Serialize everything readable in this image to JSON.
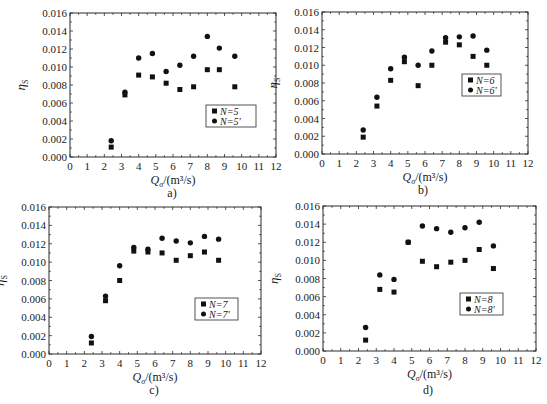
{
  "figure": {
    "x_tick_labels": [
      "0",
      "1",
      "2",
      "3",
      "4",
      "5",
      "6",
      "7",
      "8",
      "9",
      "10",
      "11",
      "12"
    ],
    "y_tick_labels": [
      "0.000",
      "0.002",
      "0.004",
      "0.006",
      "0.008",
      "0.010",
      "0.012",
      "0.014",
      "0.016"
    ],
    "xlabel": "Q_σ/(m³/s)",
    "xlabel_main": "Q",
    "xlabel_sub": "σ",
    "xlabel_unit": "/(m³/s)",
    "ylabel_main": "η",
    "ylabel_sub": "S"
  },
  "chart_data": [
    {
      "type": "scatter",
      "panel_label": "a)",
      "title": "",
      "xlabel": "Q_σ/(m³/s)",
      "ylabel": "η_S",
      "xlim": [
        0,
        12
      ],
      "ylim": [
        0,
        0.016
      ],
      "grid": false,
      "legend_position": "inside-right-lower",
      "series": [
        {
          "name": "N=5",
          "marker": "square",
          "x": [
            2.4,
            3.2,
            4.0,
            4.8,
            5.6,
            6.4,
            7.2,
            8.0,
            8.7,
            9.6
          ],
          "y": [
            0.0011,
            0.0069,
            0.0091,
            0.0089,
            0.0082,
            0.0075,
            0.0078,
            0.0097,
            0.0097,
            0.0078
          ]
        },
        {
          "name": "N=5'",
          "marker": "circle",
          "x": [
            2.4,
            3.2,
            4.0,
            4.8,
            5.6,
            6.4,
            7.2,
            8.0,
            8.7,
            9.6
          ],
          "y": [
            0.0018,
            0.0072,
            0.011,
            0.0115,
            0.0095,
            0.0102,
            0.0112,
            0.0134,
            0.0121,
            0.0112
          ]
        }
      ]
    },
    {
      "type": "scatter",
      "panel_label": "b)",
      "title": "",
      "xlabel": "Q_σ/(m³/s)",
      "ylabel": "η_S",
      "xlim": [
        0,
        12
      ],
      "ylim": [
        0,
        0.016
      ],
      "grid": false,
      "legend_position": "inside-right-middle",
      "series": [
        {
          "name": "N=6",
          "marker": "square",
          "x": [
            2.4,
            3.2,
            4.0,
            4.8,
            5.6,
            6.4,
            7.2,
            8.0,
            8.8,
            9.6
          ],
          "y": [
            0.0019,
            0.0054,
            0.0083,
            0.0104,
            0.0077,
            0.01,
            0.0126,
            0.0123,
            0.011,
            0.01
          ]
        },
        {
          "name": "N=6'",
          "marker": "circle",
          "x": [
            2.4,
            3.2,
            4.0,
            4.8,
            5.6,
            6.4,
            7.2,
            8.0,
            8.8,
            9.6
          ],
          "y": [
            0.0027,
            0.0064,
            0.0096,
            0.0109,
            0.01,
            0.0116,
            0.0131,
            0.0132,
            0.0133,
            0.0117
          ]
        }
      ]
    },
    {
      "type": "scatter",
      "panel_label": "c)",
      "title": "",
      "xlabel": "Q_σ/(m³/s)",
      "ylabel": "η_S",
      "xlim": [
        0,
        12
      ],
      "ylim": [
        0,
        0.016
      ],
      "grid": false,
      "legend_position": "inside-right-lower",
      "series": [
        {
          "name": "N=7",
          "marker": "square",
          "x": [
            2.4,
            3.2,
            4.0,
            4.8,
            5.6,
            6.4,
            7.2,
            8.0,
            8.8,
            9.6
          ],
          "y": [
            0.0012,
            0.0058,
            0.008,
            0.0112,
            0.0111,
            0.011,
            0.0102,
            0.0107,
            0.0111,
            0.0102
          ]
        },
        {
          "name": "N=7'",
          "marker": "circle",
          "x": [
            2.4,
            3.2,
            4.0,
            4.8,
            5.6,
            6.4,
            7.2,
            8.0,
            8.8,
            9.6
          ],
          "y": [
            0.0019,
            0.0063,
            0.0096,
            0.0116,
            0.0114,
            0.0126,
            0.0123,
            0.0121,
            0.0128,
            0.0125
          ]
        }
      ]
    },
    {
      "type": "scatter",
      "panel_label": "d)",
      "title": "",
      "xlabel": "Q_σ/(m³/s)",
      "ylabel": "η_S",
      "xlim": [
        0,
        12
      ],
      "ylim": [
        0,
        0.016
      ],
      "grid": false,
      "legend_position": "inside-right-lower",
      "series": [
        {
          "name": "N=8",
          "marker": "square",
          "x": [
            2.4,
            3.2,
            4.0,
            4.8,
            5.6,
            6.4,
            7.2,
            8.0,
            8.8,
            9.6
          ],
          "y": [
            0.0012,
            0.0068,
            0.0065,
            0.012,
            0.0099,
            0.0093,
            0.0098,
            0.01,
            0.0112,
            0.0091
          ]
        },
        {
          "name": "N=8'",
          "marker": "circle",
          "x": [
            2.4,
            3.2,
            4.0,
            4.8,
            5.6,
            6.4,
            7.2,
            8.0,
            8.8,
            9.6
          ],
          "y": [
            0.0026,
            0.0084,
            0.0079,
            0.012,
            0.0138,
            0.0135,
            0.0131,
            0.0136,
            0.0142,
            0.0116
          ]
        }
      ]
    }
  ],
  "layout": {
    "panels": [
      {
        "frame": [
          70,
          13,
          276,
          157
        ],
        "legend": [
          206,
          105,
          50,
          22
        ],
        "label_pos": [
          172,
          197
        ]
      },
      {
        "frame": [
          322,
          12,
          528,
          154
        ],
        "legend": [
          462,
          74,
          39,
          22
        ],
        "label_pos": [
          423,
          194
        ]
      },
      {
        "frame": [
          49,
          207,
          261,
          354
        ],
        "legend": [
          195,
          298,
          43,
          22
        ],
        "label_pos": [
          154,
          394
        ]
      },
      {
        "frame": [
          323,
          206,
          536,
          351
        ],
        "legend": [
          460,
          293,
          43,
          22
        ],
        "label_pos": [
          428,
          394
        ]
      }
    ],
    "colors": {
      "axis": "#2a2a2a",
      "marker": "#111111",
      "background": "#ffffff"
    }
  }
}
